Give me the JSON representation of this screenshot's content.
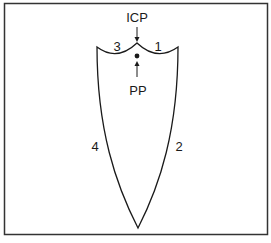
{
  "diagram": {
    "labels": {
      "top_point": "ICP",
      "bottom_point": "PP",
      "segment_top_left": "3",
      "segment_top_right": "1",
      "side_left": "4",
      "side_right": "2"
    },
    "colors": {
      "stroke": "#1a1a1a",
      "frame": "#333333",
      "background": "#ffffff"
    }
  }
}
